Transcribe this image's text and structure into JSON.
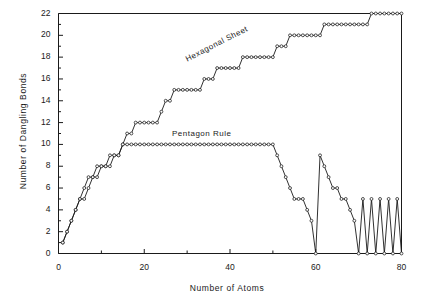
{
  "chart_data": {
    "type": "line",
    "title": "",
    "xlabel": "Number of Atoms",
    "ylabel": "Number of Dangling Bonds",
    "xlim": [
      0,
      80
    ],
    "ylim": [
      0,
      22
    ],
    "xticks": [
      0,
      20,
      40,
      60,
      80
    ],
    "xtick_labels": [
      "0",
      "20",
      "40",
      "60",
      "80"
    ],
    "x_minor_ticks": [
      10,
      30,
      50,
      70
    ],
    "yticks": [
      0,
      2,
      4,
      6,
      8,
      10,
      12,
      14,
      16,
      18,
      20,
      22
    ],
    "ytick_labels": [
      "0",
      "2",
      "4",
      "6",
      "8",
      "10",
      "12",
      "14",
      "16",
      "18",
      "20",
      "22"
    ],
    "y_minor_ticks": [
      1,
      3,
      5,
      7,
      9,
      11,
      13,
      15,
      17,
      19,
      21
    ],
    "grid": false,
    "legend_position": "inline-annotations",
    "annotations": [
      {
        "text": "Hexagonal Sheet",
        "x": 30,
        "y": 17.5,
        "rotation": -27
      },
      {
        "text": "Pentagon Rule",
        "x": 28,
        "y": 11.2,
        "rotation": 0
      }
    ],
    "marker_style": "open-circle",
    "line_color": "#1a1a1a",
    "series": [
      {
        "name": "Hexagonal Sheet",
        "x": [
          1,
          2,
          3,
          4,
          5,
          6,
          7,
          8,
          9,
          10,
          11,
          12,
          13,
          14,
          15,
          16,
          17,
          18,
          19,
          20,
          21,
          22,
          23,
          24,
          25,
          26,
          27,
          28,
          29,
          30,
          31,
          32,
          33,
          34,
          35,
          36,
          37,
          38,
          39,
          40,
          41,
          42,
          43,
          44,
          45,
          46,
          47,
          48,
          49,
          50,
          51,
          52,
          53,
          54,
          55,
          56,
          57,
          58,
          59,
          60,
          61,
          62,
          63,
          64,
          65,
          66,
          67,
          68,
          69,
          70,
          71,
          72,
          73,
          74,
          75,
          76,
          77,
          78,
          79,
          80
        ],
        "y": [
          1,
          2,
          3,
          4,
          5,
          6,
          7,
          7,
          7,
          8,
          8,
          8,
          9,
          9,
          10,
          11,
          11,
          12,
          12,
          12,
          12,
          12,
          12,
          13,
          14,
          14,
          15,
          15,
          15,
          15,
          15,
          15,
          15,
          16,
          16,
          16,
          17,
          17,
          17,
          17,
          17,
          17,
          18,
          18,
          18,
          18,
          18,
          18,
          18,
          18,
          19,
          19,
          19,
          20,
          20,
          20,
          20,
          20,
          20,
          20,
          20,
          21,
          21,
          21,
          21,
          21,
          21,
          21,
          21,
          21,
          21,
          21,
          22,
          22,
          22,
          22,
          22,
          22,
          22,
          22
        ]
      },
      {
        "name": "Pentagon Rule",
        "x": [
          1,
          2,
          3,
          4,
          5,
          6,
          7,
          8,
          9,
          10,
          11,
          12,
          13,
          14,
          15,
          16,
          17,
          18,
          19,
          20,
          21,
          22,
          23,
          24,
          25,
          26,
          27,
          28,
          29,
          30,
          31,
          32,
          33,
          34,
          35,
          36,
          37,
          38,
          39,
          40,
          41,
          42,
          43,
          44,
          45,
          46,
          47,
          48,
          49,
          50,
          51,
          52,
          53,
          54,
          55,
          56,
          57,
          58,
          59,
          60,
          61,
          62,
          63,
          64,
          65,
          66,
          67,
          68,
          69,
          70,
          71,
          72,
          73,
          74,
          75,
          76,
          77,
          78,
          79,
          80
        ],
        "y": [
          1,
          2,
          3,
          4,
          5,
          5,
          6,
          7,
          8,
          8,
          8,
          9,
          9,
          9,
          10,
          10,
          10,
          10,
          10,
          10,
          10,
          10,
          10,
          10,
          10,
          10,
          10,
          10,
          10,
          10,
          10,
          10,
          10,
          10,
          10,
          10,
          10,
          10,
          10,
          10,
          10,
          10,
          10,
          10,
          10,
          10,
          10,
          10,
          10,
          10,
          9,
          8,
          7,
          6,
          5,
          5,
          5,
          4,
          3,
          0,
          9,
          8,
          7,
          6,
          6,
          5,
          5,
          4,
          3,
          0,
          5,
          0,
          5,
          0,
          5,
          0,
          5,
          0,
          5,
          0
        ]
      }
    ]
  },
  "axes": {
    "xlabel": "Number of Atoms",
    "ylabel": "Number of Dangling Bonds"
  },
  "annotations": {
    "hexagonal_sheet": "Hexagonal Sheet",
    "pentagon_rule": "Pentagon Rule"
  }
}
